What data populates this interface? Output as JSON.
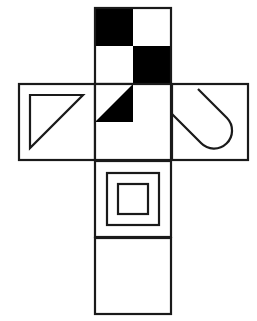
{
  "figure": {
    "background_color": "#ffffff",
    "stroke_color": "#1a1a1a",
    "fill_black": "#000000",
    "fill_white": "#ffffff",
    "stroke_width": 2.2,
    "canvas": {
      "width": 257,
      "height": 321
    },
    "layout": {
      "cell_size": 76,
      "column_left_x": 19,
      "column_mid_x": 95,
      "column_right_x": 172,
      "row_top_y": 8,
      "row_band_y": 84,
      "row_lower_y": 161,
      "row_bottom_y": 238
    },
    "cells": [
      {
        "id": "top-face",
        "name": "checkerboard-face",
        "pattern": "checkerboard-2x2",
        "x": 95,
        "y": 8,
        "size": 76,
        "quadrants": [
          {
            "position": "top-left",
            "fill": "#000000"
          },
          {
            "position": "top-right",
            "fill": "#ffffff"
          },
          {
            "position": "bottom-left",
            "fill": "#ffffff"
          },
          {
            "position": "bottom-right",
            "fill": "#000000"
          }
        ]
      },
      {
        "id": "left-face",
        "name": "outlined-triangle-face",
        "pattern": "outlined-right-triangle",
        "x": 19,
        "y": 84,
        "size": 76,
        "right_angle_corner": "top-left",
        "fill": "#ffffff"
      },
      {
        "id": "center-face",
        "name": "black-triangle-face",
        "pattern": "filled-right-triangle",
        "x": 95,
        "y": 84,
        "size": 76,
        "right_angle_corner": "bottom-right-of-left-half",
        "fill": "#000000"
      },
      {
        "id": "right-face",
        "name": "hook-curve-face",
        "pattern": "hook-u-curve",
        "x": 172,
        "y": 84,
        "size": 76,
        "fill": "#ffffff"
      },
      {
        "id": "lower-face",
        "name": "concentric-squares-face",
        "pattern": "concentric-squares",
        "x": 95,
        "y": 161,
        "size": 76,
        "rings": 2,
        "fill": "#ffffff"
      },
      {
        "id": "bottom-face",
        "name": "blank-face",
        "pattern": "empty",
        "x": 95,
        "y": 238,
        "size": 76,
        "fill": "#ffffff"
      }
    ]
  }
}
